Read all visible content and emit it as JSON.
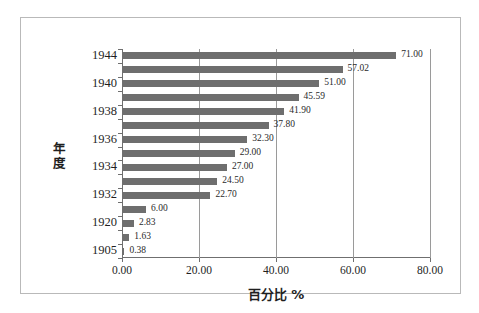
{
  "chart_data": {
    "type": "bar",
    "orientation": "horizontal",
    "title": "",
    "xlabel": "百分比 %",
    "ylabel": "年度",
    "xlim": [
      0,
      80
    ],
    "xticks": [
      "0.00",
      "20.00",
      "40.00",
      "60.00",
      "80.00"
    ],
    "xtick_values": [
      0,
      20,
      40,
      60,
      80
    ],
    "grid": "vertical",
    "legend": "none",
    "bar_color": "#6e6e6e",
    "categories": [
      "1944",
      "",
      "1940",
      "",
      "1938",
      "",
      "1936",
      "",
      "1934",
      "",
      "1932",
      "",
      "1920",
      "",
      "1905"
    ],
    "values": [
      71.0,
      57.02,
      51.0,
      45.59,
      41.9,
      37.8,
      32.3,
      29.0,
      27.0,
      24.5,
      22.7,
      6.0,
      2.83,
      1.63,
      0.38
    ],
    "data_labels": [
      "71.00",
      "57.02",
      "51.00",
      "45.59",
      "41.90",
      "37.80",
      "32.30",
      "29.00",
      "27.00",
      "24.50",
      "22.70",
      "6.00",
      "2.83",
      "1.63",
      "0.38"
    ],
    "ytick_labels": [
      {
        "index": 0,
        "label": "1944"
      },
      {
        "index": 2,
        "label": "1940"
      },
      {
        "index": 4,
        "label": "1938"
      },
      {
        "index": 6,
        "label": "1936"
      },
      {
        "index": 8,
        "label": "1934"
      },
      {
        "index": 10,
        "label": "1932"
      },
      {
        "index": 12,
        "label": "1920"
      },
      {
        "index": 14,
        "label": "1905"
      }
    ]
  }
}
